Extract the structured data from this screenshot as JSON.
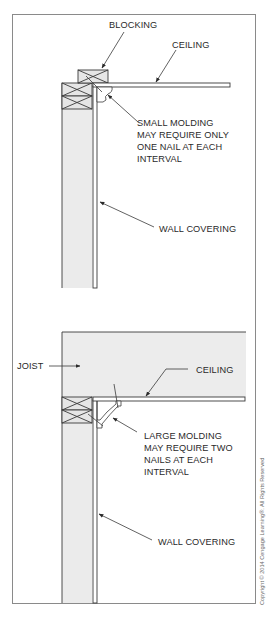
{
  "figure": {
    "top_detail": {
      "labels": {
        "blocking": "BLOCKING",
        "ceiling": "CEILING",
        "molding_note": [
          "SMALL MOLDING",
          "MAY REQUIRE ONLY",
          "ONE NAIL AT EACH",
          "INTERVAL"
        ],
        "wall_covering": "WALL COVERING"
      }
    },
    "bottom_detail": {
      "labels": {
        "joist": "JOIST",
        "ceiling": "CEILING",
        "molding_note": [
          "LARGE MOLDING",
          "MAY REQUIRE TWO",
          "NAILS AT EACH",
          "INTERVAL"
        ],
        "wall_covering": "WALL COVERING"
      }
    },
    "copyright": "Copyright © 2014 Cengage Learning®. All Rights Reserved"
  },
  "colors": {
    "line": "#3a3a3a",
    "wood_fill": "#e6e6e6",
    "frame": "#8a8a8a",
    "background": "#ffffff"
  }
}
